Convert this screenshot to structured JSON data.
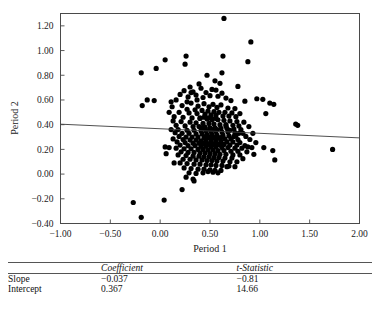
{
  "chart_data": {
    "type": "scatter",
    "title": "",
    "xlabel": "Period 1",
    "ylabel": "Period 2",
    "xlim": [
      -1.0,
      2.0
    ],
    "ylim": [
      -0.4,
      1.3
    ],
    "xticks": [
      "-1.00",
      "-0.50",
      "0.00",
      "0.50",
      "1.00",
      "1.50",
      "2.00"
    ],
    "xtick_values": [
      -1.0,
      -0.5,
      0.0,
      0.5,
      1.0,
      1.5,
      2.0
    ],
    "yticks": [
      "1.20",
      "1.00",
      "0.80",
      "0.60",
      "0.40",
      "0.20",
      "0.00",
      "-0.20",
      "-0.40"
    ],
    "ytick_values": [
      1.2,
      1.0,
      0.8,
      0.6,
      0.4,
      0.2,
      0.0,
      -0.2,
      -0.4
    ],
    "grid": false,
    "legend": "none",
    "marker_color": "#000000",
    "marker_size": 2.6,
    "fit_line": {
      "label": "least-squares fit",
      "slope": -0.037,
      "intercept": 0.367,
      "color": "#3c3c3c",
      "x_start": -1.0,
      "x_end": 2.0
    },
    "points": [
      [
        0.64,
        1.26
      ],
      [
        0.91,
        1.07
      ],
      [
        0.63,
        0.955
      ],
      [
        0.26,
        0.955
      ],
      [
        0.05,
        0.925
      ],
      [
        0.88,
        0.91
      ],
      [
        0.62,
        0.82
      ],
      [
        -0.19,
        0.82
      ],
      [
        0.25,
        0.89
      ],
      [
        -0.04,
        0.855
      ],
      [
        0.47,
        0.8
      ],
      [
        0.55,
        0.755
      ],
      [
        0.6,
        0.735
      ],
      [
        0.39,
        0.73
      ],
      [
        0.3,
        0.705
      ],
      [
        0.78,
        0.71
      ],
      [
        0.41,
        0.695
      ],
      [
        0.52,
        0.685
      ],
      [
        0.56,
        0.68
      ],
      [
        0.24,
        0.675
      ],
      [
        0.33,
        0.665
      ],
      [
        0.46,
        0.66
      ],
      [
        0.62,
        0.655
      ],
      [
        0.2,
        0.645
      ],
      [
        0.36,
        0.64
      ],
      [
        0.5,
        0.635
      ],
      [
        0.58,
        0.63
      ],
      [
        0.28,
        0.625
      ],
      [
        0.43,
        0.62
      ],
      [
        0.66,
        0.615
      ],
      [
        0.97,
        0.61
      ],
      [
        1.03,
        0.605
      ],
      [
        -0.13,
        0.6
      ],
      [
        -0.06,
        0.595
      ],
      [
        0.16,
        0.6
      ],
      [
        0.71,
        0.595
      ],
      [
        0.85,
        0.59
      ],
      [
        1.1,
        0.575
      ],
      [
        1.14,
        0.565
      ],
      [
        -0.18,
        0.555
      ],
      [
        0.11,
        0.585
      ],
      [
        0.31,
        0.575
      ],
      [
        0.44,
        0.57
      ],
      [
        0.53,
        0.565
      ],
      [
        0.61,
        0.56
      ],
      [
        0.22,
        0.555
      ],
      [
        0.38,
        0.55
      ],
      [
        0.49,
        0.545
      ],
      [
        0.57,
        0.54
      ],
      [
        0.68,
        0.535
      ],
      [
        0.75,
        0.53
      ],
      [
        0.27,
        0.525
      ],
      [
        0.35,
        0.52
      ],
      [
        0.42,
        0.515
      ],
      [
        0.48,
        0.51
      ],
      [
        0.54,
        0.505
      ],
      [
        0.59,
        0.5
      ],
      [
        0.65,
        0.5
      ],
      [
        0.72,
        0.495
      ],
      [
        0.8,
        0.49
      ],
      [
        1.06,
        0.49
      ],
      [
        0.19,
        0.5
      ],
      [
        0.29,
        0.495
      ],
      [
        0.37,
        0.49
      ],
      [
        0.45,
        0.485
      ],
      [
        0.51,
        0.48
      ],
      [
        0.56,
        0.475
      ],
      [
        0.63,
        0.47
      ],
      [
        0.69,
        0.47
      ],
      [
        0.76,
        0.465
      ],
      [
        1.36,
        0.405
      ],
      [
        1.38,
        0.395
      ],
      [
        0.14,
        0.465
      ],
      [
        0.23,
        0.46
      ],
      [
        0.32,
        0.455
      ],
      [
        0.4,
        0.45
      ],
      [
        0.47,
        0.445
      ],
      [
        0.52,
        0.44
      ],
      [
        0.58,
        0.44
      ],
      [
        0.64,
        0.435
      ],
      [
        0.7,
        0.43
      ],
      [
        0.77,
        0.425
      ],
      [
        0.84,
        0.42
      ],
      [
        0.13,
        0.43
      ],
      [
        0.21,
        0.425
      ],
      [
        0.3,
        0.42
      ],
      [
        0.36,
        0.415
      ],
      [
        0.43,
        0.41
      ],
      [
        0.49,
        0.41
      ],
      [
        0.54,
        0.405
      ],
      [
        0.6,
        0.4
      ],
      [
        0.66,
        0.4
      ],
      [
        0.73,
        0.395
      ],
      [
        0.79,
        0.39
      ],
      [
        0.89,
        0.385
      ],
      [
        0.16,
        0.395
      ],
      [
        0.25,
        0.39
      ],
      [
        0.33,
        0.385
      ],
      [
        0.39,
        0.385
      ],
      [
        0.45,
        0.38
      ],
      [
        0.5,
        0.375
      ],
      [
        0.55,
        0.375
      ],
      [
        0.61,
        0.37
      ],
      [
        0.67,
        0.37
      ],
      [
        0.74,
        0.365
      ],
      [
        0.81,
        0.36
      ],
      [
        0.11,
        0.36
      ],
      [
        0.18,
        0.36
      ],
      [
        0.27,
        0.355
      ],
      [
        0.34,
        0.355
      ],
      [
        0.41,
        0.35
      ],
      [
        0.46,
        0.35
      ],
      [
        0.51,
        0.345
      ],
      [
        0.56,
        0.345
      ],
      [
        0.62,
        0.34
      ],
      [
        0.68,
        0.34
      ],
      [
        0.75,
        0.335
      ],
      [
        0.83,
        0.33
      ],
      [
        0.93,
        0.33
      ],
      [
        0.15,
        0.335
      ],
      [
        0.22,
        0.33
      ],
      [
        0.29,
        0.33
      ],
      [
        0.36,
        0.325
      ],
      [
        0.42,
        0.325
      ],
      [
        0.47,
        0.32
      ],
      [
        0.52,
        0.32
      ],
      [
        0.57,
        0.315
      ],
      [
        0.63,
        0.315
      ],
      [
        0.69,
        0.31
      ],
      [
        0.76,
        0.31
      ],
      [
        0.86,
        0.305
      ],
      [
        0.19,
        0.305
      ],
      [
        0.26,
        0.3
      ],
      [
        0.32,
        0.3
      ],
      [
        0.38,
        0.3
      ],
      [
        0.44,
        0.295
      ],
      [
        0.49,
        0.295
      ],
      [
        0.54,
        0.29
      ],
      [
        0.59,
        0.29
      ],
      [
        0.65,
        0.285
      ],
      [
        0.71,
        0.285
      ],
      [
        0.78,
        0.28
      ],
      [
        0.9,
        0.28
      ],
      [
        0.13,
        0.285
      ],
      [
        0.23,
        0.28
      ],
      [
        0.3,
        0.275
      ],
      [
        0.36,
        0.275
      ],
      [
        0.41,
        0.27
      ],
      [
        0.46,
        0.27
      ],
      [
        0.51,
        0.265
      ],
      [
        0.56,
        0.265
      ],
      [
        0.61,
        0.26
      ],
      [
        0.67,
        0.26
      ],
      [
        0.73,
        0.26
      ],
      [
        0.8,
        0.255
      ],
      [
        0.96,
        0.255
      ],
      [
        0.17,
        0.26
      ],
      [
        0.25,
        0.255
      ],
      [
        0.33,
        0.25
      ],
      [
        0.39,
        0.25
      ],
      [
        0.44,
        0.25
      ],
      [
        0.49,
        0.245
      ],
      [
        0.54,
        0.245
      ],
      [
        0.59,
        0.24
      ],
      [
        0.64,
        0.24
      ],
      [
        0.7,
        0.235
      ],
      [
        0.77,
        0.235
      ],
      [
        0.85,
        0.23
      ],
      [
        0.2,
        0.235
      ],
      [
        0.28,
        0.23
      ],
      [
        0.35,
        0.23
      ],
      [
        0.41,
        0.225
      ],
      [
        0.46,
        0.225
      ],
      [
        0.51,
        0.22
      ],
      [
        0.56,
        0.22
      ],
      [
        0.62,
        0.215
      ],
      [
        0.68,
        0.215
      ],
      [
        0.75,
        0.21
      ],
      [
        0.82,
        0.21
      ],
      [
        0.92,
        0.215
      ],
      [
        1.04,
        0.215
      ],
      [
        1.73,
        0.2
      ],
      [
        0.09,
        0.215
      ],
      [
        0.16,
        0.21
      ],
      [
        0.24,
        0.205
      ],
      [
        0.31,
        0.205
      ],
      [
        0.38,
        0.2
      ],
      [
        0.43,
        0.2
      ],
      [
        0.48,
        0.195
      ],
      [
        0.53,
        0.195
      ],
      [
        0.58,
        0.19
      ],
      [
        0.64,
        0.19
      ],
      [
        0.71,
        0.185
      ],
      [
        0.78,
        0.185
      ],
      [
        0.87,
        0.18
      ],
      [
        1.13,
        0.19
      ],
      [
        0.05,
        0.22
      ],
      [
        0.06,
        0.165
      ],
      [
        0.21,
        0.18
      ],
      [
        0.28,
        0.175
      ],
      [
        0.34,
        0.175
      ],
      [
        0.4,
        0.17
      ],
      [
        0.45,
        0.17
      ],
      [
        0.5,
        0.165
      ],
      [
        0.55,
        0.165
      ],
      [
        0.6,
        0.16
      ],
      [
        0.66,
        0.16
      ],
      [
        0.73,
        0.155
      ],
      [
        0.8,
        0.155
      ],
      [
        0.94,
        0.16
      ],
      [
        0.14,
        0.09
      ],
      [
        0.18,
        0.155
      ],
      [
        0.26,
        0.15
      ],
      [
        0.33,
        0.145
      ],
      [
        0.39,
        0.145
      ],
      [
        0.44,
        0.14
      ],
      [
        0.49,
        0.14
      ],
      [
        0.54,
        0.135
      ],
      [
        0.59,
        0.135
      ],
      [
        0.65,
        0.13
      ],
      [
        0.72,
        0.13
      ],
      [
        0.83,
        0.125
      ],
      [
        1.15,
        0.115
      ],
      [
        0.23,
        0.12
      ],
      [
        0.3,
        0.12
      ],
      [
        0.36,
        0.115
      ],
      [
        0.42,
        0.115
      ],
      [
        0.47,
        0.11
      ],
      [
        0.52,
        0.11
      ],
      [
        0.57,
        0.105
      ],
      [
        0.63,
        0.105
      ],
      [
        0.7,
        0.1
      ],
      [
        0.77,
        0.1
      ],
      [
        0.2,
        0.09
      ],
      [
        0.27,
        0.085
      ],
      [
        0.34,
        0.08
      ],
      [
        0.4,
        0.08
      ],
      [
        0.46,
        0.075
      ],
      [
        0.51,
        0.075
      ],
      [
        0.56,
        0.07
      ],
      [
        0.62,
        0.07
      ],
      [
        0.69,
        0.065
      ],
      [
        0.75,
        0.06
      ],
      [
        0.24,
        0.05
      ],
      [
        0.31,
        0.045
      ],
      [
        0.38,
        0.04
      ],
      [
        0.44,
        0.04
      ],
      [
        0.5,
        0.035
      ],
      [
        0.55,
        0.03
      ],
      [
        0.61,
        0.03
      ],
      [
        0.67,
        0.06
      ],
      [
        0.29,
        0.01
      ],
      [
        0.36,
        0.005
      ],
      [
        0.43,
        0.01
      ],
      [
        0.48,
        0.02
      ],
      [
        0.53,
        0.015
      ],
      [
        0.58,
        0.01
      ],
      [
        0.26,
        -0.025
      ],
      [
        0.33,
        -0.04
      ],
      [
        0.34,
        -0.055
      ],
      [
        0.22,
        -0.125
      ],
      [
        0.04,
        -0.21
      ],
      [
        -0.27,
        -0.23
      ],
      [
        -0.19,
        -0.35
      ],
      [
        0.4,
        0.455
      ],
      [
        0.44,
        0.46
      ],
      [
        0.48,
        0.455
      ],
      [
        0.52,
        0.45
      ],
      [
        0.56,
        0.45
      ],
      [
        0.41,
        0.375
      ],
      [
        0.45,
        0.37
      ],
      [
        0.5,
        0.365
      ],
      [
        0.53,
        0.36
      ],
      [
        0.57,
        0.36
      ],
      [
        0.46,
        0.305
      ],
      [
        0.5,
        0.3
      ],
      [
        0.53,
        0.3
      ],
      [
        0.58,
        0.295
      ],
      [
        0.61,
        0.295
      ],
      [
        0.42,
        0.245
      ],
      [
        0.47,
        0.24
      ],
      [
        0.5,
        0.24
      ],
      [
        0.55,
        0.235
      ],
      [
        0.6,
        0.235
      ],
      [
        0.66,
        0.39
      ],
      [
        0.7,
        0.355
      ],
      [
        0.74,
        0.305
      ],
      [
        0.79,
        0.33
      ],
      [
        0.88,
        0.22
      ],
      [
        0.31,
        0.66
      ],
      [
        0.37,
        0.6
      ],
      [
        0.27,
        0.585
      ],
      [
        0.12,
        0.545
      ],
      [
        0.09,
        0.5
      ]
    ]
  },
  "table": {
    "columns": [
      "",
      "Coefficient",
      "t-Statistic"
    ],
    "rows": [
      {
        "label": "Slope",
        "coefficient": "−0.037",
        "t_statistic": "−0.81"
      },
      {
        "label": "Intercept",
        "coefficient": "0.367",
        "t_statistic": "14.66"
      }
    ]
  }
}
